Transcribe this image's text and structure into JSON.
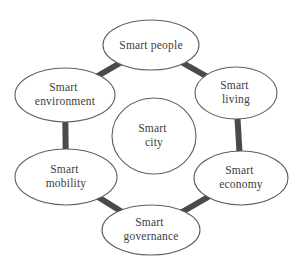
{
  "diagram": {
    "name": "Smart city concept diagram",
    "colors": {
      "background": "#ffffff",
      "ellipse_fill": "#ffffff",
      "ellipse_stroke": "#5f5f5f",
      "connector": "#4a4a4a",
      "text": "#3d3d3d"
    },
    "nodes": {
      "city": {
        "label": "Smart city",
        "lines": [
          "Smart",
          "city"
        ]
      },
      "people": {
        "label": "Smart people",
        "lines": [
          "Smart people"
        ]
      },
      "environment": {
        "label": "Smart environment",
        "lines": [
          "Smart",
          "environment"
        ]
      },
      "living": {
        "label": "Smart living",
        "lines": [
          "Smart",
          "living"
        ]
      },
      "mobility": {
        "label": "Smart mobility",
        "lines": [
          "Smart",
          "mobility"
        ]
      },
      "economy": {
        "label": "Smart economy",
        "lines": [
          "Smart",
          "economy"
        ]
      },
      "governance": {
        "label": "Smart governance",
        "lines": [
          "Smart",
          "governance"
        ]
      }
    },
    "connections": [
      [
        "Smart environment",
        "Smart people"
      ],
      [
        "Smart people",
        "Smart living"
      ],
      [
        "Smart living",
        "Smart economy"
      ],
      [
        "Smart economy",
        "Smart governance"
      ],
      [
        "Smart governance",
        "Smart mobility"
      ],
      [
        "Smart mobility",
        "Smart environment"
      ]
    ]
  }
}
